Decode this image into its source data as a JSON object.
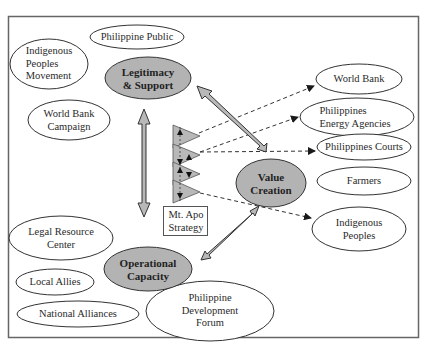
{
  "diagram": {
    "type": "strategy-triangle-network",
    "core_nodes": [
      {
        "id": "legitimacy",
        "label_lines": [
          "Legitimacy",
          "& Support"
        ],
        "fill": "#b3b3b3"
      },
      {
        "id": "value",
        "label_lines": [
          "Value",
          "Creation"
        ],
        "fill": "#b3b3b3"
      },
      {
        "id": "operational",
        "label_lines": [
          "Operational",
          "Capacity"
        ],
        "fill": "#b3b3b3"
      }
    ],
    "strategy": {
      "label_lines": [
        "Mt. Apo",
        "Strategy"
      ]
    },
    "legitimacy_stakeholders": [
      {
        "id": "philippine-public",
        "label_lines": [
          "Philippine Public"
        ]
      },
      {
        "id": "indigenous-movement",
        "label_lines": [
          "Indigenous",
          "Peoples",
          "Movement"
        ]
      },
      {
        "id": "wb-campaign",
        "label_lines": [
          "World Bank",
          "Campaign"
        ]
      }
    ],
    "value_stakeholders": [
      {
        "id": "world-bank",
        "label_lines": [
          "World Bank"
        ]
      },
      {
        "id": "energy-agencies",
        "label_lines": [
          "Philippines",
          "Energy Agencies"
        ]
      },
      {
        "id": "courts",
        "label_lines": [
          "Philippines Courts"
        ]
      },
      {
        "id": "farmers",
        "label_lines": [
          "Farmers"
        ]
      },
      {
        "id": "indigenous-peoples",
        "label_lines": [
          "Indigenous",
          "Peoples"
        ]
      }
    ],
    "operational_stakeholders": [
      {
        "id": "legal-resource",
        "label_lines": [
          "Legal Resource",
          "Center"
        ]
      },
      {
        "id": "local-allies",
        "label_lines": [
          "Local Allies"
        ]
      },
      {
        "id": "national-alliances",
        "label_lines": [
          "National Alliances"
        ]
      },
      {
        "id": "pdf",
        "label_lines": [
          "Philippine",
          "Development",
          "Forum"
        ]
      }
    ],
    "colors": {
      "core_fill": "#b3b3b3",
      "arrow_fill": "#b8b8b8",
      "stroke": "#3a3a3a",
      "frame": "#666666"
    }
  }
}
